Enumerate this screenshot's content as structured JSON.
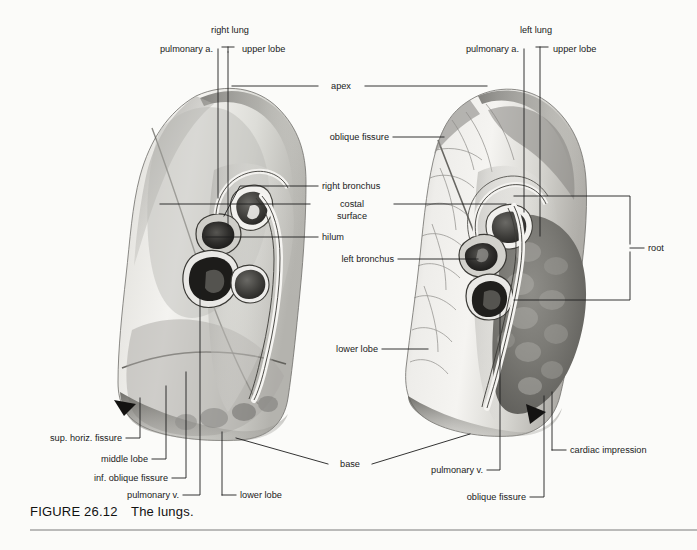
{
  "figure": {
    "caption_number": "FIGURE 26.12",
    "caption_title": "The lungs.",
    "background_color": "#fbfbf9",
    "ink_color": "#1d1d1d"
  },
  "labels": {
    "right_lung": "right lung",
    "left_lung": "left lung",
    "pulmonary_a_right": "pulmonary a.",
    "pulmonary_a_left": "pulmonary a.",
    "upper_lobe_right": "upper lobe",
    "upper_lobe_left": "upper lobe",
    "apex": "apex",
    "oblique_fissure_top": "oblique fissure",
    "right_bronchus": "right bronchus",
    "costal_surface_line1": "costal",
    "costal_surface_line2": "surface",
    "hilum": "hilum",
    "left_bronchus": "left bronchus",
    "root": "root",
    "lower_lobe_center": "lower lobe",
    "sup_horiz_fissure": "sup. horiz. fissure",
    "middle_lobe": "middle lobe",
    "inf_oblique_fissure": "inf. oblique fissure",
    "pulmonary_v_left_side": "pulmonary v.",
    "lower_lobe_bottom": "lower lobe",
    "base": "base",
    "pulmonary_v_right_side": "pulmonary v.",
    "oblique_fissure_bottom": "oblique fissure",
    "cardiac_impression": "cardiac impression"
  },
  "anatomy": {
    "right_lung_lobes": [
      "upper lobe",
      "middle lobe",
      "lower lobe"
    ],
    "left_lung_lobes": [
      "upper lobe",
      "lower lobe"
    ],
    "root_structures": [
      "pulmonary a.",
      "bronchus",
      "pulmonary v."
    ],
    "fissures_right": [
      "sup. horiz. fissure",
      "inf. oblique fissure"
    ],
    "fissures_left": [
      "oblique fissure"
    ],
    "surfaces": [
      "costal surface",
      "cardiac impression",
      "hilum",
      "apex",
      "base"
    ]
  }
}
